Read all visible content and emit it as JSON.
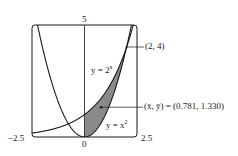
{
  "figure": {
    "type": "function-plot",
    "curves": [
      {
        "name": "exponential",
        "label_prefix": "y = 2",
        "label_sup": "x",
        "equation": "y = 2^x"
      },
      {
        "name": "parabola",
        "label_prefix": "y = x",
        "label_sup": "2",
        "equation": "y = x^2"
      }
    ],
    "axes": {
      "x_min_label": "−2.5",
      "x_max_label": "2.5",
      "x_origin_label": "0",
      "y_max_label": "5",
      "xlim": [
        -2.5,
        2.5
      ],
      "ylim": [
        0,
        5
      ]
    },
    "annotations": {
      "intersection": "(2, 4)",
      "centroid": "(x̄, ȳ) = (0.781, 1.330)",
      "centroid_x": 0.781,
      "centroid_y": 1.33
    },
    "shaded_region": {
      "between": [
        "y = 2^x",
        "y = x^2"
      ],
      "x_from": 0,
      "x_to": 2,
      "color": "#8a8a8a"
    },
    "colors": {
      "line": "#1a1a1a",
      "frame": "#1a1a1a",
      "shade": "#8a8a8a"
    }
  }
}
